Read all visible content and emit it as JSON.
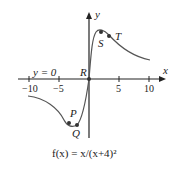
{
  "figure": {
    "caption": "f(x) = x/(x+4)²",
    "axes": {
      "x_label": "x",
      "y_label": "y",
      "x_ticks": [
        "−10",
        "−5",
        "5",
        "10"
      ],
      "asymptote_label": "y = 0"
    },
    "points": [
      {
        "name": "P",
        "label": "P"
      },
      {
        "name": "Q",
        "label": "Q"
      },
      {
        "name": "R",
        "label": "R"
      },
      {
        "name": "S",
        "label": "S"
      },
      {
        "name": "T",
        "label": "T"
      }
    ],
    "colors": {
      "curve": "#555555",
      "axis": "#222222",
      "point": "#333333"
    }
  }
}
